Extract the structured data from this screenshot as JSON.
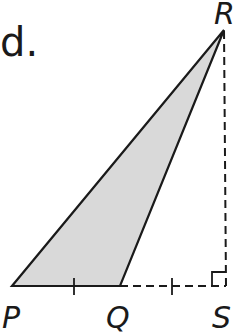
{
  "part_label": "d.",
  "figure": {
    "type": "triangle-diagram",
    "shaded_triangle": [
      "P",
      "Q",
      "R"
    ],
    "fill_color": "#d9d9d9",
    "stroke_color": "#1a1a1a",
    "vertices": {
      "P": {
        "label": "P",
        "x": 12,
        "y": 286
      },
      "Q": {
        "label": "Q",
        "x": 120,
        "y": 286
      },
      "S": {
        "label": "S",
        "x": 226,
        "y": 286
      },
      "R": {
        "label": "R",
        "x": 224,
        "y": 30
      }
    },
    "dashed_segments": [
      [
        "Q",
        "S"
      ],
      [
        "S",
        "R"
      ]
    ],
    "congruence_ticks": [
      "PQ",
      "QS"
    ],
    "right_angle_at": "S"
  }
}
